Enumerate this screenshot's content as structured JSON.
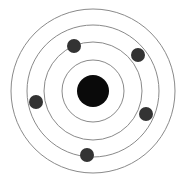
{
  "diagram": {
    "type": "bohr-atom-model",
    "nucleus": {
      "cx": 93,
      "cy": 91,
      "r": 16,
      "color": "#0a0a0a"
    },
    "orbits": [
      {
        "r": 31
      },
      {
        "r": 49
      },
      {
        "r": 66
      },
      {
        "r": 82
      }
    ],
    "orbit_color": "#8a8a8a",
    "electron_color": "#333333",
    "electron_radius": 7,
    "electrons": [
      {
        "cx": 74,
        "cy": 46
      },
      {
        "cx": 138,
        "cy": 55
      },
      {
        "cx": 36,
        "cy": 102
      },
      {
        "cx": 146,
        "cy": 114
      },
      {
        "cx": 87,
        "cy": 155
      }
    ]
  }
}
